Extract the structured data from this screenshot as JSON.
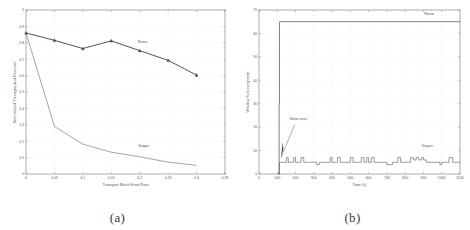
{
  "figure": {
    "panels": [
      {
        "caption": "(a)",
        "xlabel": "Transport Block Error Rate",
        "ylabel": "Normalized Throughput of Receiver",
        "series_labels": {
          "reno": "Reno",
          "vegas": "Vegas"
        }
      },
      {
        "caption": "(b)",
        "xlabel": "Time (s)",
        "ylabel": "Window Size (segment)",
        "series_labels": {
          "reno": "Reno",
          "vegas": "Vegas"
        },
        "annotation": "Slow start"
      }
    ]
  },
  "chart_data": [
    {
      "type": "line",
      "title": "",
      "xlabel": "Transport Block Error Rate",
      "ylabel": "Normalized Throughput of Receiver",
      "xlim": [
        0,
        0.35
      ],
      "ylim": [
        0,
        1
      ],
      "xticks": [
        0,
        0.05,
        0.1,
        0.15,
        0.2,
        0.25,
        0.3,
        0.35
      ],
      "xticklabels": [
        "0",
        "0.05",
        "0.1",
        "0.15",
        "0.2",
        "0.25",
        "0.3",
        "0.35"
      ],
      "yticks": [
        0,
        0.1,
        0.2,
        0.3,
        0.4,
        0.5,
        0.6,
        0.7,
        0.8,
        0.9,
        1
      ],
      "yticklabels": [
        "0",
        "0.1",
        "0.2",
        "0.3",
        "0.4",
        "0.5",
        "0.6",
        "0.7",
        "0.8",
        "0.9",
        "1"
      ],
      "grid": true,
      "legend_position": "inline-annotation",
      "x": [
        0,
        0.05,
        0.1,
        0.15,
        0.2,
        0.25,
        0.3
      ],
      "series": [
        {
          "name": "Reno",
          "marker": "triangle",
          "values": [
            0.86,
            0.815,
            0.765,
            0.812,
            0.752,
            0.693,
            0.603
          ]
        },
        {
          "name": "Vegas",
          "marker": "none",
          "values": [
            0.86,
            0.29,
            0.182,
            0.133,
            0.105,
            0.072,
            0.053
          ]
        }
      ],
      "annotations": [
        {
          "text": "Reno",
          "x": 0.205,
          "y": 0.8
        },
        {
          "text": "Vegas",
          "x": 0.207,
          "y": 0.165
        }
      ]
    },
    {
      "type": "line",
      "title": "",
      "xlabel": "Time (s)",
      "ylabel": "Window Size (segment)",
      "xlim": [
        0,
        1100
      ],
      "ylim": [
        0,
        70
      ],
      "xticks": [
        0,
        100,
        200,
        300,
        400,
        500,
        600,
        700,
        800,
        900,
        1000,
        1100
      ],
      "xticklabels": [
        "0",
        "100",
        "200",
        "300",
        "400",
        "500",
        "600",
        "700",
        "800",
        "900",
        "1000",
        "1100"
      ],
      "yticks": [
        0,
        10,
        20,
        30,
        40,
        50,
        60,
        70
      ],
      "yticklabels": [
        "0",
        "10",
        "20",
        "30",
        "40",
        "50",
        "60",
        "70"
      ],
      "grid": true,
      "legend_position": "inline-annotation",
      "series": [
        {
          "name": "Reno",
          "x": [
            105,
            110,
            112,
            1100
          ],
          "values": [
            0,
            30,
            65,
            65
          ]
        },
        {
          "name": "Vegas",
          "x": [
            105,
            112,
            120,
            135,
            150,
            160,
            175,
            190,
            200,
            215,
            230,
            245,
            260,
            275,
            290,
            300,
            315,
            330,
            345,
            360,
            375,
            390,
            400,
            415,
            430,
            445,
            460,
            475,
            490,
            500,
            515,
            530,
            545,
            560,
            575,
            590,
            600,
            615,
            630,
            645,
            660,
            675,
            690,
            700,
            715,
            730,
            745,
            760,
            775,
            790,
            800,
            815,
            830,
            845,
            860,
            875,
            890,
            900,
            915,
            930,
            945,
            960,
            975,
            990,
            1000,
            1020,
            1040,
            1060,
            1080,
            1100
          ],
          "values": [
            0,
            5,
            5,
            5,
            7,
            5,
            5,
            7,
            5,
            5,
            7,
            5,
            5,
            5,
            5,
            5,
            4,
            5,
            5,
            5,
            5,
            7,
            5,
            5,
            7,
            5,
            5,
            5,
            5,
            7,
            5,
            5,
            5,
            7,
            5,
            7,
            5,
            7,
            5,
            5,
            5,
            5,
            5,
            4,
            4,
            5,
            5,
            7,
            5,
            5,
            5,
            5,
            7,
            6,
            7,
            6,
            7,
            6,
            5,
            5,
            5,
            5,
            5,
            4,
            5,
            5,
            7,
            5,
            5,
            5
          ]
        }
      ],
      "annotations": [
        {
          "text": "Reno",
          "x": 930,
          "y": 68
        },
        {
          "text": "Vegas",
          "x": 920,
          "y": 11.5
        },
        {
          "text": "Slow start",
          "x": 215,
          "y": 23
        }
      ]
    }
  ]
}
